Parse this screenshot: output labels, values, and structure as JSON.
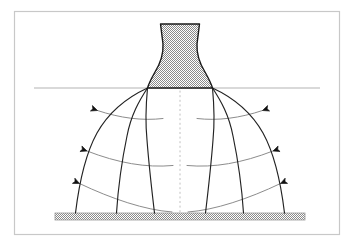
{
  "figure": {
    "background_color": "#ffffff",
    "frame": {
      "name": "figure-border",
      "x": 14.5,
      "y": 11.5,
      "width": 325,
      "height": 223,
      "stroke": "#c8c8c8",
      "stroke_width": 1.2
    },
    "centerline": {
      "name": "axis-of-symmetry",
      "x": 180,
      "y_top": 86,
      "y_bottom": 216,
      "stroke": "#c0c0c0",
      "dash": "2,2.6",
      "stroke_width": 1
    },
    "exit_plane": {
      "name": "nozzle-exit-plane-line",
      "x1": 34,
      "x2": 320,
      "y": 88,
      "stroke": "#b4b4b4",
      "stroke_width": 1.1
    },
    "nozzle": {
      "name": "nozzle-body",
      "fill_pattern": "stipple-checker",
      "pattern_color": "#8a8a8a",
      "stroke": "#1a1a1a",
      "stroke_width": 1.4,
      "top_y": 24,
      "exit_y": 88,
      "top_left_x": 160.5,
      "top_right_x": 199.5,
      "throat_left_x": 163.5,
      "throat_right_x": 196.5,
      "exit_left_x": 147.5,
      "exit_right_x": 212.5,
      "path": "M160.5,24 L163.0,44 C163.6,56 160.0,64 155.0,72 C151.6,78 149.0,83 147.5,88 L212.5,88 C211.0,83 208.4,78 205.0,72 C200.0,64 196.4,56 197.0,44 L199.5,24 Z"
    },
    "ground": {
      "name": "impingement-plate",
      "x": 55,
      "y": 213,
      "width": 250,
      "height": 7,
      "fill_pattern": "stipple-checker",
      "pattern_color": "#8a8a8a",
      "stroke": "#9a9a9a",
      "stroke_width": 0.8
    },
    "streamlines": {
      "name": "flow-streamlines",
      "stroke": "#222222",
      "stroke_width": 1.15,
      "fill": "none",
      "count_per_side": 3,
      "origin_left": {
        "x": 147.5,
        "y": 88
      },
      "origin_right": {
        "x": 212.5,
        "y": 88
      },
      "left_paths": [
        "M147.5,88 C128,97 110,110 97,133 C86,153 79,184 75.5,213",
        "M147.5,88 C139,101 131,115 127,136 C122,160 118,190 116.5,213",
        "M147.5,88 C146,104 145,120 147,140 C149,166 152,192 154.5,213"
      ],
      "right_paths": [
        "M212.5,88 C232,97 250,110 263,133 C274,153 281,184 284.5,213",
        "M212.5,88 C221,101 229,115 233,136 C238,160 242,190 243.5,213",
        "M212.5,88 C214,104 215,120 213,140 C211,166 208,192 205.5,213"
      ]
    },
    "isocurves": {
      "name": "velocity-profile-curves",
      "stroke": "#8c8c8c",
      "stroke_width": 1,
      "fill": "none",
      "left_paths": [
        "M97.5,110.5 C120,118 142,121 163,118.5",
        "M87.0,151.0 C118,163 146,168 173,165.5",
        "M79.5,183.5 C112,199 145,210 172,212.0"
      ],
      "right_paths": [
        "M262.5,110.5 C240,118 218,121 197,118.5",
        "M273.0,151.0 C242,163 214,168 187,165.5",
        "M280.5,183.5 C248,199 215,210 188,212.0"
      ]
    },
    "arrows": {
      "name": "flow-direction-arrows",
      "color": "#111111",
      "head_size": 3.4,
      "left": [
        {
          "tip_x": 97.5,
          "tip_y": 110.5,
          "angle_deg": 200
        },
        {
          "tip_x": 87.0,
          "tip_y": 151.0,
          "angle_deg": 200
        },
        {
          "tip_x": 79.5,
          "tip_y": 183.5,
          "angle_deg": 205
        }
      ],
      "right": [
        {
          "tip_x": 262.5,
          "tip_y": 110.5,
          "angle_deg": 340
        },
        {
          "tip_x": 273.0,
          "tip_y": 151.0,
          "angle_deg": 340
        },
        {
          "tip_x": 280.5,
          "tip_y": 183.5,
          "angle_deg": 335
        }
      ]
    }
  }
}
